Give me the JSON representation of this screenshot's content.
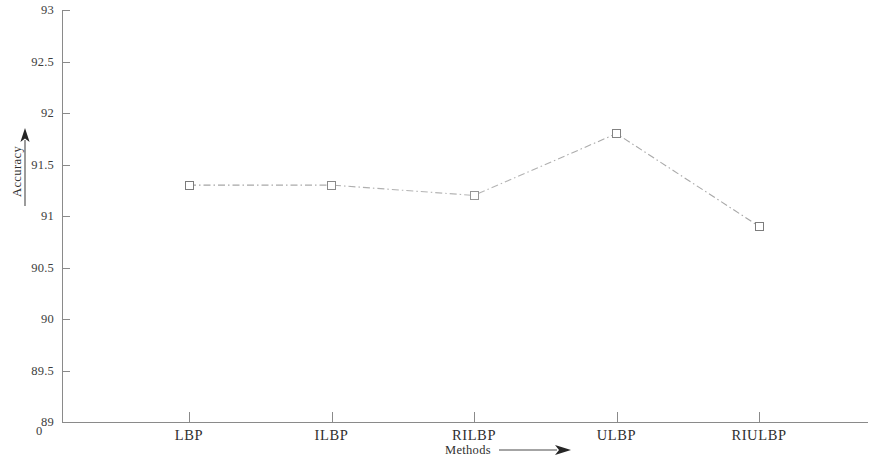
{
  "chart_data": {
    "type": "line",
    "title": "",
    "xlabel": "Methods",
    "ylabel": "Accuracy",
    "categories": [
      "LBP",
      "ILBP",
      "RILBP",
      "ULBP",
      "RIULBP"
    ],
    "values": [
      91.3,
      91.3,
      91.2,
      91.8,
      90.9
    ],
    "series": [
      {
        "name": "Accuracy",
        "values": [
          91.3,
          91.3,
          91.2,
          91.8,
          90.9
        ],
        "marker": "open-square",
        "line_style": "dash-dot",
        "color": "#8a8a8a"
      }
    ],
    "ylim": [
      89,
      93
    ],
    "ytick_step": 0.5,
    "ytick_labels": [
      "93",
      "92.5",
      "92",
      "91.5",
      "91",
      "90.5",
      "90",
      "89.5",
      "89"
    ],
    "ytick_values": [
      93,
      92.5,
      92,
      91.5,
      91,
      90.5,
      90,
      89.5,
      89
    ],
    "origin_label": "0",
    "grid": false,
    "legend": null,
    "xlabel_arrow": "right-arrow-icon",
    "ylabel_arrow": "up-arrow-icon"
  },
  "axes": {
    "y_title": "Accuracy",
    "x_title": "Methods",
    "origin": "0"
  }
}
